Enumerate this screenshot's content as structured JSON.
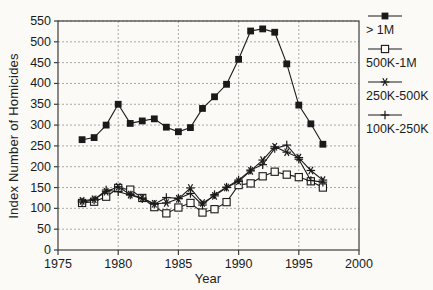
{
  "figure": {
    "background": "#fbfaf7"
  },
  "chart_data": {
    "type": "line",
    "title": "",
    "xlabel": "Year",
    "ylabel": "Index Number of Homicides",
    "xlim": [
      1975,
      2000
    ],
    "ylim": [
      0,
      550
    ],
    "x_ticks": [
      1975,
      1980,
      1985,
      1990,
      1995,
      2000
    ],
    "y_ticks": [
      0,
      50,
      100,
      150,
      200,
      250,
      300,
      350,
      400,
      450,
      500,
      550
    ],
    "grid": true,
    "legend_position": "right",
    "colors": {
      "ink": "#1a1a1a",
      "grid": "#a9a9a9",
      "frame": "#3d3d3d"
    },
    "x": [
      1977,
      1978,
      1979,
      1980,
      1981,
      1982,
      1983,
      1984,
      1985,
      1986,
      1987,
      1988,
      1989,
      1990,
      1991,
      1992,
      1993,
      1994,
      1995,
      1996,
      1997
    ],
    "series": [
      {
        "name": "> 1M",
        "marker": "filled-square",
        "values": [
          265,
          270,
          300,
          350,
          304,
          310,
          315,
          295,
          284,
          294,
          340,
          368,
          398,
          458,
          526,
          531,
          523,
          447,
          348,
          303,
          254
        ]
      },
      {
        "name": "500K-1M",
        "marker": "open-square",
        "values": [
          113,
          116,
          128,
          149,
          145,
          125,
          103,
          88,
          102,
          113,
          90,
          98,
          115,
          156,
          160,
          177,
          188,
          181,
          175,
          165,
          150
        ]
      },
      {
        "name": "250K-500K",
        "marker": "asterisk",
        "values": [
          118,
          122,
          140,
          152,
          133,
          125,
          111,
          113,
          123,
          149,
          113,
          130,
          150,
          165,
          190,
          216,
          248,
          235,
          222,
          191,
          168
        ]
      },
      {
        "name": "100K-250K",
        "marker": "plus",
        "values": [
          115,
          120,
          144,
          140,
          132,
          123,
          110,
          126,
          124,
          136,
          108,
          133,
          151,
          168,
          192,
          205,
          244,
          252,
          218,
          167,
          163
        ]
      }
    ]
  }
}
